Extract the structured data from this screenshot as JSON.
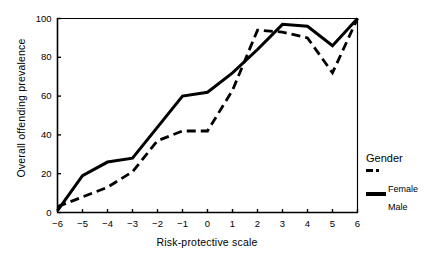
{
  "chart_data": {
    "type": "line",
    "title": "",
    "xlabel": "Risk-protective scale",
    "ylabel": "Overall offending prevalence",
    "x": [
      -6,
      -5,
      -4,
      -3,
      -2,
      -1,
      0,
      1,
      2,
      3,
      4,
      5,
      6
    ],
    "xticklabels": [
      "−6",
      "−5",
      "−4",
      "−3",
      "−2",
      "−1",
      "0",
      "1",
      "2",
      "3",
      "4",
      "5",
      "6"
    ],
    "yticks": [
      0,
      20,
      40,
      60,
      80,
      100
    ],
    "yticklabels": [
      "0",
      "20",
      "40",
      "60",
      "80",
      "100"
    ],
    "xlim": [
      -6,
      6
    ],
    "ylim": [
      0,
      100
    ],
    "grid": false,
    "legend_position": "right",
    "legend_title": "Gender",
    "series": [
      {
        "name": "Female",
        "style": "dashed",
        "color": "#000000",
        "values": [
          3,
          8,
          13,
          21,
          37,
          42,
          42,
          63,
          94,
          93,
          90,
          72,
          100
        ]
      },
      {
        "name": "Male",
        "style": "solid",
        "color": "#000000",
        "values": [
          1,
          19,
          26,
          28,
          44,
          60,
          62,
          72,
          84,
          97,
          96,
          86,
          100
        ]
      }
    ]
  },
  "axes": {
    "ylabel": "Overall offending prevalence",
    "xlabel": "Risk-protective scale"
  },
  "legend": {
    "title": "Gender",
    "female_label": "Female",
    "male_label": "Male"
  }
}
